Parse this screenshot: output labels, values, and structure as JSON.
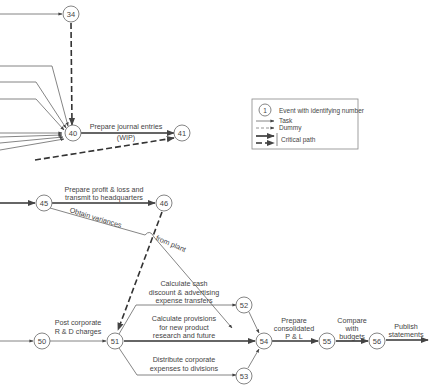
{
  "diagram": {
    "type": "PERT network",
    "nodes": [
      {
        "id": "34",
        "label": "34"
      },
      {
        "id": "40",
        "label": "40"
      },
      {
        "id": "41",
        "label": "41"
      },
      {
        "id": "45",
        "label": "45"
      },
      {
        "id": "46",
        "label": "46"
      },
      {
        "id": "50",
        "label": "50"
      },
      {
        "id": "51",
        "label": "51"
      },
      {
        "id": "52",
        "label": "52"
      },
      {
        "id": "53",
        "label": "53"
      },
      {
        "id": "54",
        "label": "54"
      },
      {
        "id": "55",
        "label": "55"
      },
      {
        "id": "56",
        "label": "56"
      }
    ],
    "activities": {
      "a40_41": {
        "line1": "Prepare journal entries",
        "line2": "(WIP)"
      },
      "a45_46": {
        "line1": "Prepare profit & loss and",
        "line2": "transmit to headquarters"
      },
      "a45_54": {
        "part1": "Obtain variances",
        "part2": "from plant"
      },
      "a50_51": {
        "line1": "Post corporate",
        "line2": "R & D charges"
      },
      "a51_52": {
        "line1": "Calculate cash",
        "line2": "discount & advertising",
        "line3": "expense transfers"
      },
      "a51_54": {
        "line1": "Calculate provisions",
        "line2": "for new product",
        "line3": "research and future"
      },
      "a51_53": {
        "line1": "Distribute corporate",
        "line2": "expenses to divisions"
      },
      "a54_55": {
        "line1": "Prepare",
        "line2": "consolidated",
        "line3": "P & L"
      },
      "a55_56": {
        "line1": "Compare",
        "line2": "with",
        "line3": "budgets"
      },
      "a56_out": {
        "line1": "Publish",
        "line2": "statements"
      }
    },
    "legend": {
      "event_symbol": "1",
      "event": "Event with identifying number",
      "task": "Task",
      "dummy": "Dummy",
      "critical": "Critical path"
    }
  }
}
